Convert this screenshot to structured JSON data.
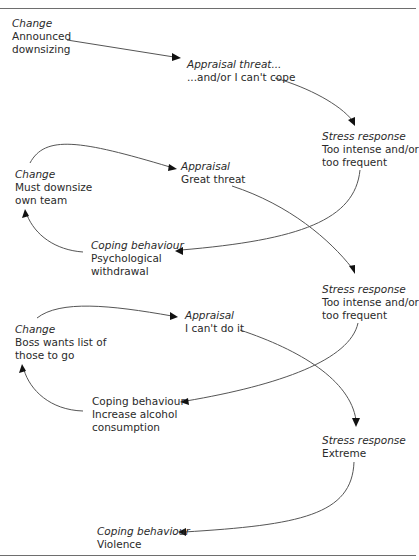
{
  "header": {
    "text": "Applied psychology"
  },
  "nodes": {
    "change1": {
      "category": "Change",
      "lines": [
        "Announced",
        "downsizing"
      ]
    },
    "appraisal1": {
      "category": "Appraisal threat...",
      "lines": [
        "...and/or I can't cope"
      ]
    },
    "stress1": {
      "category": "Stress response",
      "lines": [
        "Too intense and/or",
        "too frequent"
      ]
    },
    "change2": {
      "category": "Change",
      "lines": [
        "Must downsize",
        "own team"
      ]
    },
    "appraisal2": {
      "category": "Appraisal",
      "lines": [
        "Great threat"
      ]
    },
    "coping1": {
      "category": "Coping behaviour",
      "lines": [
        "Psychological",
        "withdrawal"
      ]
    },
    "stress2": {
      "category": "Stress response",
      "lines": [
        "Too intense and/or",
        "too frequent"
      ]
    },
    "change3": {
      "category": "Change",
      "lines": [
        "Boss wants list of",
        "those to go"
      ]
    },
    "appraisal3": {
      "category": "Appraisal",
      "lines": [
        "I can't do it"
      ]
    },
    "coping2": {
      "category": "Coping behaviour",
      "lines": [
        "Increase alcohol",
        "consumption"
      ]
    },
    "stress3": {
      "category": "Stress response",
      "lines": [
        "Extreme"
      ]
    },
    "coping3": {
      "category": "Coping behaviour",
      "lines": [
        "Violence"
      ]
    }
  },
  "edges": [
    {
      "from": "change1",
      "to": "appraisal1"
    },
    {
      "from": "appraisal1",
      "to": "stress1"
    },
    {
      "from": "stress1",
      "to": "coping1"
    },
    {
      "from": "coping1",
      "to": "change2"
    },
    {
      "from": "change2",
      "to": "appraisal2"
    },
    {
      "from": "appraisal2",
      "to": "stress2"
    },
    {
      "from": "stress2",
      "to": "coping2"
    },
    {
      "from": "coping2",
      "to": "change3"
    },
    {
      "from": "change3",
      "to": "appraisal3"
    },
    {
      "from": "appraisal3",
      "to": "stress3"
    },
    {
      "from": "stress3",
      "to": "coping3"
    }
  ]
}
